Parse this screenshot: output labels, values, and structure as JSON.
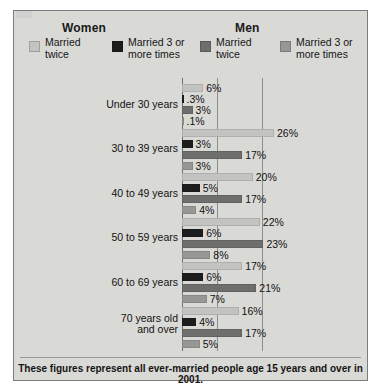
{
  "panel": {
    "background": "#d9d9d6",
    "border_color": "#7c7c7c"
  },
  "header": {
    "women_title": "Women",
    "men_title": "Men"
  },
  "legend": {
    "position": "top",
    "items": [
      {
        "label": "Married\ntwice",
        "group": "Women",
        "color": "#c3c3c1"
      },
      {
        "label": "Married 3 or\nmore times",
        "group": "Women",
        "color": "#1d1d1d"
      },
      {
        "label": "Married\ntwice",
        "group": "Men",
        "color": "#6e6e6c"
      },
      {
        "label": "Married 3 or\nmore times",
        "group": "Men",
        "color": "#979794"
      }
    ]
  },
  "footer": {
    "note": "These figures represent all ever-married people age 15 years and over in 2001."
  },
  "chart_data": {
    "type": "bar",
    "orientation": "horizontal",
    "title": "",
    "subtitle": "",
    "xlabel": "",
    "ylabel": "",
    "xlim": [
      0,
      27
    ],
    "grid": true,
    "gridlines": [
      10,
      22.5
    ],
    "value_suffix": "%",
    "legend_position": "top",
    "categories": [
      "Under 30 years",
      "30 to 39 years",
      "40 to 49 years",
      "50 to 59 years",
      "60 to 69 years",
      "70 years old\nand over"
    ],
    "series": [
      {
        "name": "Women - Married twice",
        "color": "#c3c3c1",
        "values": [
          6,
          26,
          20,
          22,
          17,
          16
        ],
        "labels": [
          "6%",
          "26%",
          "20%",
          "22%",
          "17%",
          "16%"
        ]
      },
      {
        "name": "Women - Married 3 or more times",
        "color": "#1d1d1d",
        "values": [
          0.3,
          3,
          5,
          6,
          6,
          4
        ],
        "labels": [
          ".3%",
          "3%",
          "5%",
          "6%",
          "6%",
          "4%"
        ]
      },
      {
        "name": "Men - Married twice",
        "color": "#6e6e6c",
        "values": [
          3,
          17,
          17,
          23,
          21,
          17
        ],
        "labels": [
          "3%",
          "17%",
          "17%",
          "23%",
          "21%",
          "17%"
        ]
      },
      {
        "name": "Men - Married 3 or more times",
        "color": "#979794",
        "values": [
          0.1,
          3,
          4,
          8,
          7,
          5
        ],
        "labels": [
          ".1%",
          "3%",
          "4%",
          "8%",
          "7%",
          "5%"
        ]
      }
    ]
  }
}
